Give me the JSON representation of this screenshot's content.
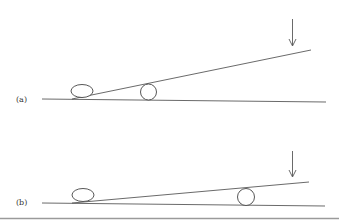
{
  "panels": [
    {
      "label": "(a)",
      "description": "Inclined plank resting on ellipse at left end and roller near left-middle, downward force applied at right end"
    },
    {
      "label": "(b)",
      "description": "Inclined plank resting on ellipse at left end and roller near right end, downward force applied at right end"
    }
  ],
  "colors": {
    "line": "#444444",
    "background": "#ffffff",
    "bottom_rule": "#9a9a9a"
  }
}
